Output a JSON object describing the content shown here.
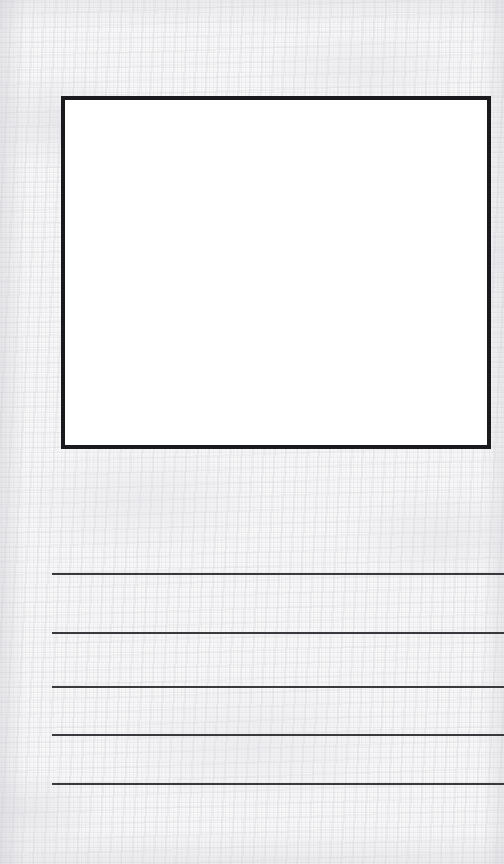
{
  "page": {
    "width": 504,
    "height": 864,
    "kind": "blank-drawing-and-writing-worksheet",
    "background_color": "#f1f1f2",
    "texture": "woven paper / fabric weave",
    "visible_text": ""
  },
  "drawing_box": {
    "label": "",
    "x": 61,
    "y": 96,
    "width": 430,
    "height": 353,
    "border_width": 4,
    "border_color": "#1a1a1e",
    "fill_color": "#ffffff",
    "content": ""
  },
  "writing_area": {
    "line_color": "#3a3a3e",
    "line_thickness": 2,
    "line_start_x": 52,
    "line_end_x": 504,
    "count": 5,
    "lines": [
      {
        "index": 1,
        "y": 573,
        "text": ""
      },
      {
        "index": 2,
        "y": 632,
        "text": ""
      },
      {
        "index": 3,
        "y": 686,
        "text": ""
      },
      {
        "index": 4,
        "y": 734,
        "text": ""
      },
      {
        "index": 5,
        "y": 783,
        "text": ""
      }
    ]
  }
}
